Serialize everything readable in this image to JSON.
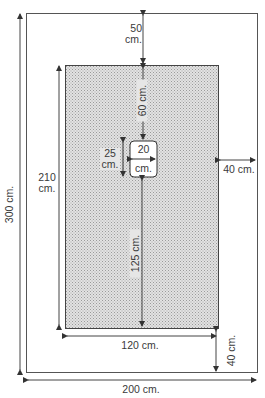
{
  "diagram": {
    "outer": {
      "width_label": "200 cm.",
      "height_label": "300 cm."
    },
    "inner": {
      "width_label": "120 cm.",
      "height_label_num": "210",
      "height_label_unit": "cm."
    },
    "margins": {
      "top_num": "50",
      "top_unit": "cm.",
      "right": "40 cm.",
      "bottom": "40 cm."
    },
    "hole": {
      "width_num": "20",
      "width_unit": "cm.",
      "height_num": "25",
      "height_unit": "cm.",
      "top_offset": "60 cm.",
      "bottom_offset": "125 cm."
    },
    "colors": {
      "line": "#444444",
      "fill": "#d4d4d4"
    }
  }
}
